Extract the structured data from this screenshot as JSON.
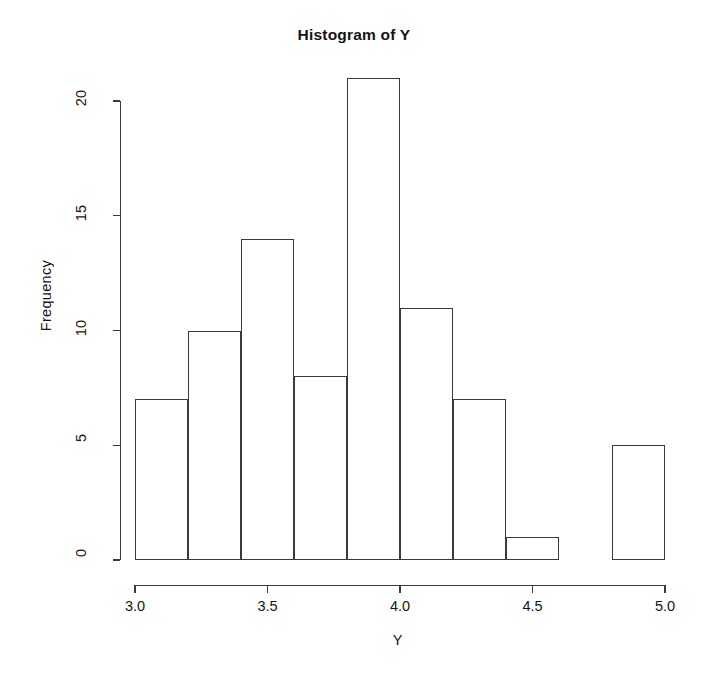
{
  "chart_data": {
    "type": "bar",
    "title": "Histogram of Y",
    "xlabel": "Y",
    "ylabel": "Frequency",
    "bin_width": 0.2,
    "bin_edges": [
      3.0,
      3.2,
      3.4,
      3.6,
      3.8,
      4.0,
      4.2,
      4.4,
      4.6,
      4.8,
      5.0
    ],
    "categories": [
      "3.0-3.2",
      "3.2-3.4",
      "3.4-3.6",
      "3.6-3.8",
      "3.8-4.0",
      "4.0-4.2",
      "4.2-4.4",
      "4.4-4.6",
      "4.6-4.8",
      "4.8-5.0"
    ],
    "values": [
      7,
      10,
      14,
      8,
      21,
      11,
      7,
      1,
      0,
      5
    ],
    "xlim": [
      3.0,
      5.0
    ],
    "ylim": [
      0,
      21
    ],
    "xticks": [
      3.0,
      3.5,
      4.0,
      4.5,
      5.0
    ],
    "xtick_labels": [
      "3.0",
      "3.5",
      "4.0",
      "4.5",
      "5.0"
    ],
    "yticks": [
      0,
      5,
      10,
      15,
      20
    ],
    "ytick_labels": [
      "0",
      "5",
      "10",
      "15",
      "20"
    ],
    "grid": false,
    "legend": null,
    "bar_fill": "#ffffff",
    "bar_stroke": "#3a3a3a",
    "axis_color": "#3a3a3a",
    "background": "#ffffff"
  },
  "artifact": {
    "bottom_smudge": ""
  }
}
